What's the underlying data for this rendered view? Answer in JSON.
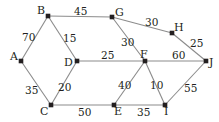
{
  "figure": {
    "background_color": "#ffffff",
    "edge_color": "#8b8b8b",
    "node_color": "#231f20",
    "label_color": "#231f20",
    "width": 219,
    "height": 122
  },
  "graph_data": {
    "type": "node-link-diagram",
    "directed": false,
    "weighted": true,
    "nodes": [
      {
        "id": "A",
        "label": "A",
        "x": 21,
        "y": 61,
        "label_x": 10,
        "label_y": 51
      },
      {
        "id": "B",
        "label": "B",
        "x": 48,
        "y": 16,
        "label_x": 37,
        "label_y": 5
      },
      {
        "id": "C",
        "label": "C",
        "x": 51,
        "y": 105,
        "label_x": 40,
        "label_y": 106
      },
      {
        "id": "D",
        "label": "D",
        "x": 77,
        "y": 61,
        "label_x": 64,
        "label_y": 57
      },
      {
        "id": "E",
        "label": "E",
        "x": 114,
        "y": 105,
        "label_x": 114,
        "label_y": 106
      },
      {
        "id": "F",
        "label": "F",
        "x": 145,
        "y": 61,
        "label_x": 140,
        "label_y": 49
      },
      {
        "id": "G",
        "label": "G",
        "x": 112,
        "y": 17,
        "label_x": 115,
        "label_y": 7
      },
      {
        "id": "H",
        "label": "H",
        "x": 172,
        "y": 33,
        "label_x": 174,
        "label_y": 22
      },
      {
        "id": "I",
        "label": "I",
        "x": 165,
        "y": 105,
        "label_x": 164,
        "label_y": 106
      },
      {
        "id": "J",
        "label": "J",
        "x": 206,
        "y": 61,
        "label_x": 209,
        "label_y": 57
      }
    ],
    "edges": [
      {
        "source": "A",
        "target": "B",
        "weight": 70,
        "label_x": 22,
        "label_y": 32
      },
      {
        "source": "A",
        "target": "C",
        "weight": 35,
        "label_x": 25,
        "label_y": 85
      },
      {
        "source": "B",
        "target": "D",
        "weight": 15,
        "label_x": 63,
        "label_y": 33
      },
      {
        "source": "B",
        "target": "G",
        "weight": 45,
        "label_x": 74,
        "label_y": 6
      },
      {
        "source": "C",
        "target": "D",
        "weight": 20,
        "label_x": 58,
        "label_y": 82
      },
      {
        "source": "C",
        "target": "E",
        "weight": 50,
        "label_x": 78,
        "label_y": 107
      },
      {
        "source": "D",
        "target": "F",
        "weight": 25,
        "label_x": 101,
        "label_y": 50
      },
      {
        "source": "G",
        "target": "F",
        "weight": 30,
        "label_x": 121,
        "label_y": 37
      },
      {
        "source": "G",
        "target": "H",
        "weight": 30,
        "label_x": 145,
        "label_y": 17
      },
      {
        "source": "H",
        "target": "J",
        "weight": 25,
        "label_x": 190,
        "label_y": 38
      },
      {
        "source": "F",
        "target": "J",
        "weight": 60,
        "label_x": 172,
        "label_y": 50
      },
      {
        "source": "F",
        "target": "E",
        "weight": 40,
        "label_x": 118,
        "label_y": 80
      },
      {
        "source": "F",
        "target": "I",
        "weight": 10,
        "label_x": 150,
        "label_y": 80
      },
      {
        "source": "E",
        "target": "I",
        "weight": 35,
        "label_x": 137,
        "label_y": 107
      },
      {
        "source": "I",
        "target": "J",
        "weight": 55,
        "label_x": 184,
        "label_y": 83
      }
    ]
  }
}
